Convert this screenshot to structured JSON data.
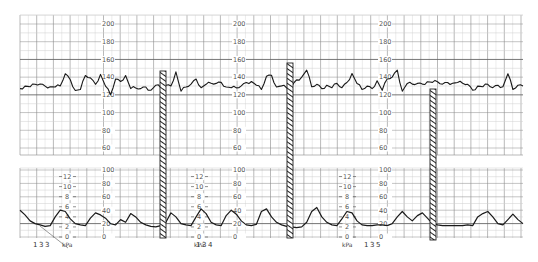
{
  "chart_data": {
    "type": "line",
    "title": "",
    "panels": [
      {
        "name": "fetal_heart_rate",
        "ylabel": "bpm",
        "ylim": [
          50,
          210
        ],
        "tick_labels": [
          "200",
          "180",
          "160",
          "140",
          "120",
          "100",
          "80",
          "60"
        ],
        "grid": true,
        "baseline_approx": 128,
        "series": [
          {
            "name": "FHR",
            "x": [
              0,
              5,
              10,
              15,
              20,
              25,
              30,
              35,
              40,
              45,
              50,
              55,
              60,
              65,
              70,
              75,
              80,
              85,
              90,
              95,
              100,
              105,
              110,
              115,
              120,
              125,
              130,
              135,
              140,
              145,
              150,
              155,
              160,
              165,
              170,
              175,
              180,
              185,
              190,
              195,
              200,
              205,
              210,
              215,
              220,
              225,
              230,
              235,
              240,
              245,
              250,
              255,
              260,
              265,
              270,
              275,
              280,
              285,
              290,
              295,
              300,
              305,
              310,
              315,
              320,
              325,
              330,
              335,
              340,
              345,
              350,
              355,
              360,
              365,
              370,
              375,
              380,
              385,
              390,
              395,
              400,
              405,
              410,
              415,
              420,
              425,
              430,
              435,
              440,
              445,
              450,
              455,
              460,
              465,
              470,
              475,
              480,
              485,
              490,
              495,
              500
            ],
            "values": [
              128,
              129,
              130,
              131,
              133,
              129,
              130,
              128,
              131,
              143,
              138,
              124,
              127,
              141,
              140,
              131,
              144,
              129,
              121,
              137,
              136,
              141,
              128,
              127,
              128,
              128,
              126,
              130,
              129,
              130,
              131,
              145,
              125,
              128,
              133,
              137,
              129,
              131,
              134,
              132,
              135,
              128,
              129,
              127,
              131,
              133,
              136,
              130,
              127,
              140,
              143,
              128,
              131,
              127,
              130,
              136,
              141,
              147,
              130,
              131,
              128,
              130,
              129,
              132,
              129,
              133,
              145,
              132,
              127,
              129,
              128,
              135,
              126,
              137,
              141,
              147,
              125,
              132,
              133,
              132,
              133,
              134,
              135,
              134,
              133,
              133,
              134,
              133,
              134,
              131,
              126,
              129,
              130,
              131,
              129,
              130,
              130,
              143,
              127,
              130,
              131
            ]
          }
        ]
      },
      {
        "name": "uterine_activity",
        "ylabel": "kPa",
        "ylim": [
          0,
          100
        ],
        "tick_labels_mmHg": [
          "100",
          "80",
          "60",
          "40",
          "20",
          "0"
        ],
        "tick_labels_kPa": [
          "12",
          "10",
          "8",
          "6",
          "4",
          "2",
          "0"
        ],
        "grid": true,
        "series": [
          {
            "name": "UA",
            "x": [
              0,
              5,
              10,
              15,
              20,
              25,
              30,
              35,
              40,
              45,
              50,
              55,
              60,
              65,
              70,
              75,
              80,
              85,
              90,
              95,
              100,
              105,
              110,
              115,
              120,
              125,
              130,
              135,
              140,
              145,
              150,
              155,
              160,
              165,
              170,
              175,
              180,
              185,
              190,
              195,
              200,
              205,
              210,
              215,
              220,
              225,
              230,
              235,
              240,
              245,
              250,
              255,
              260,
              265,
              270,
              275,
              280,
              285,
              290,
              295,
              300,
              305,
              310,
              315,
              320,
              325,
              330,
              335,
              340,
              345,
              350,
              355,
              360,
              365,
              370,
              375,
              380,
              385,
              390,
              395,
              400,
              405,
              410,
              415,
              420,
              425,
              430,
              435,
              440,
              445,
              450,
              455,
              460,
              465,
              470,
              475,
              480,
              485,
              490,
              495,
              500
            ],
            "values": [
              40,
              33,
              24,
              20,
              18,
              16,
              17,
              30,
              40,
              38,
              27,
              20,
              18,
              17,
              28,
              36,
              33,
              28,
              20,
              18,
              26,
              22,
              35,
              30,
              22,
              18,
              16,
              15,
              17,
              22,
              36,
              30,
              20,
              18,
              17,
              30,
              42,
              35,
              22,
              18,
              17,
              32,
              40,
              34,
              24,
              18,
              17,
              19,
              38,
              42,
              30,
              22,
              18,
              16,
              15,
              14,
              15,
              22,
              38,
              44,
              30,
              22,
              18,
              17,
              27,
              38,
              36,
              24,
              18,
              17,
              17,
              18,
              18,
              17,
              20,
              30,
              38,
              30,
              24,
              32,
              36,
              28,
              20,
              18,
              17,
              17,
              17,
              17,
              17,
              18,
              17,
              30,
              35,
              38,
              30,
              20,
              18,
              26,
              34,
              26,
              20
            ]
          }
        ]
      }
    ],
    "segment_labels": [
      "133",
      "134",
      "135"
    ],
    "unit_label": "kPa",
    "event_markers": [
      {
        "x_px": 163,
        "top_px": 71,
        "bottom_px": 238
      },
      {
        "x_px": 290,
        "top_px": 63,
        "bottom_px": 238
      },
      {
        "x_px": 433,
        "top_px": 89,
        "bottom_px": 240
      }
    ]
  },
  "labels": {
    "segments": [
      "133",
      "134",
      "135"
    ],
    "unit": "kPa",
    "fhr_ticks": [
      "200",
      "180",
      "160",
      "140",
      "120",
      "100",
      "80",
      "60"
    ],
    "ua_ticks": [
      "100",
      "80",
      "60",
      "40",
      "20",
      "0"
    ],
    "kpa_ticks": [
      "12",
      "10",
      "8",
      "6",
      "4",
      "2",
      "0"
    ]
  },
  "colors": {
    "trace": "#1a1a1a",
    "grid_major": "#8a8a8a",
    "grid_minor": "#cfcfcf",
    "label": "#555555"
  }
}
